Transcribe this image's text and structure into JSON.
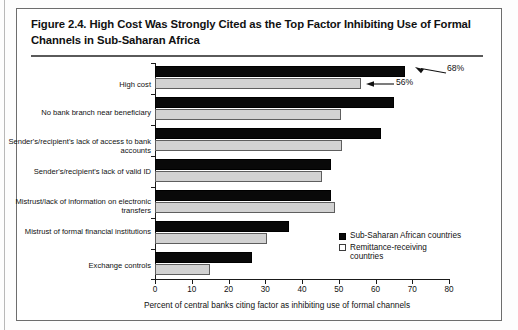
{
  "figure": {
    "title": "Figure 2.4. High Cost Was Strongly Cited as the Top Factor Inhibiting Use of Formal Channels in Sub-Saharan Africa"
  },
  "chart_data": {
    "type": "bar",
    "orientation": "horizontal",
    "title": "Figure 2.4. High Cost Was Strongly Cited as the Top Factor Inhibiting Use of Formal Channels in Sub-Saharan Africa",
    "xlabel": "Percent of central banks citing factor as inhibiting use of formal channels",
    "ylabel": "",
    "xlim": [
      0,
      80
    ],
    "xticks": [
      0,
      10,
      20,
      30,
      40,
      50,
      60,
      70,
      80
    ],
    "xtick_labels": [
      "0",
      "10",
      "20",
      "30",
      "40",
      "50",
      "60",
      "70",
      "80"
    ],
    "grid": false,
    "legend_position": "inside-right-lower",
    "categories": [
      "High cost",
      "No bank branch near beneficiary",
      "Sender's/recipient's lack of access to bank accounts",
      "Sender's/recipient's lack of valid ID",
      "Mistrust/lack of information on electronic transfers",
      "Mistrust of formal financial institutions",
      "Exchange controls"
    ],
    "series": [
      {
        "name": "Sub-Saharan African countries",
        "color": "#090909",
        "values": [
          68,
          65,
          61.5,
          48,
          48,
          36.5,
          26.5
        ]
      },
      {
        "name": "Remittance-receiving countries",
        "color": "#d2d2d2",
        "values": [
          56,
          50.5,
          51,
          45.5,
          49,
          30.5,
          15
        ]
      }
    ],
    "annotations": [
      {
        "text": "68%",
        "series": "Sub-Saharan African countries",
        "category": "High cost",
        "value": 68
      },
      {
        "text": "56%",
        "series": "Remittance-receiving countries",
        "category": "High cost",
        "value": 56
      }
    ]
  },
  "legend": {
    "items": [
      {
        "label": "Sub-Saharan African countries",
        "swatch": "dark"
      },
      {
        "label": "Remittance-receiving countries",
        "swatch": "light"
      }
    ]
  }
}
